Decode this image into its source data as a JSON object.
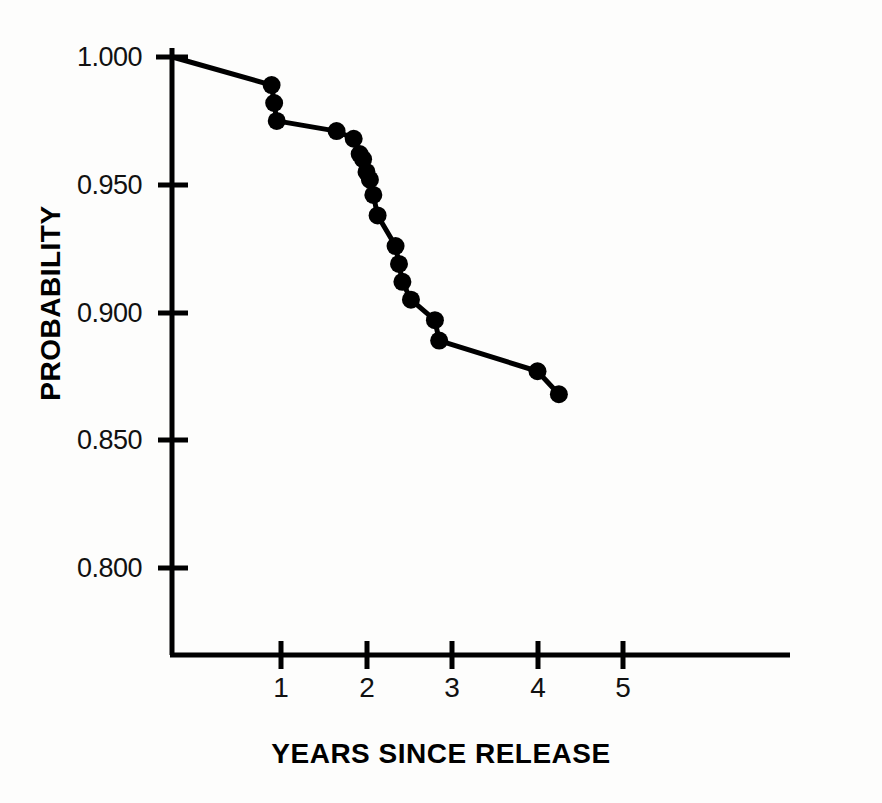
{
  "chart_data": {
    "type": "line",
    "title": "",
    "subtitle": "",
    "xlabel": "YEARS SINCE RELEASE",
    "ylabel": "PROBABILITY",
    "xlim": [
      -0.28,
      6.0
    ],
    "ylim": [
      0.766,
      1.005
    ],
    "grid": false,
    "legend": null,
    "marker": "filled-circle",
    "line_color": "#000000",
    "marker_color": "#000000",
    "background_color": "#fdfdfc",
    "xticks": [
      1,
      2,
      3,
      4,
      5
    ],
    "xtick_labels": [
      "1",
      "2",
      "3",
      "4",
      "5"
    ],
    "yticks": [
      1.0,
      0.95,
      0.9,
      0.85,
      0.8
    ],
    "ytick_labels": [
      "1.000",
      "0.950",
      "0.900",
      "0.850",
      "0.800"
    ],
    "x": [
      -0.27,
      0.89,
      0.92,
      0.95,
      1.65,
      1.85,
      1.92,
      1.96,
      2.0,
      2.04,
      2.08,
      2.13,
      2.34,
      2.38,
      2.42,
      2.52,
      2.8,
      2.85,
      4.0,
      4.25
    ],
    "y": [
      1.0,
      0.989,
      0.982,
      0.975,
      0.971,
      0.968,
      0.962,
      0.96,
      0.955,
      0.952,
      0.946,
      0.938,
      0.926,
      0.919,
      0.912,
      0.905,
      0.897,
      0.889,
      0.877,
      0.868
    ],
    "points": [
      {
        "x": -0.27,
        "y": 1.0,
        "marker": false
      },
      {
        "x": 0.89,
        "y": 0.989,
        "marker": true
      },
      {
        "x": 0.92,
        "y": 0.982,
        "marker": true
      },
      {
        "x": 0.95,
        "y": 0.975,
        "marker": true
      },
      {
        "x": 1.65,
        "y": 0.971,
        "marker": true
      },
      {
        "x": 1.85,
        "y": 0.968,
        "marker": true
      },
      {
        "x": 1.92,
        "y": 0.962,
        "marker": true
      },
      {
        "x": 1.96,
        "y": 0.96,
        "marker": true
      },
      {
        "x": 2.0,
        "y": 0.955,
        "marker": true
      },
      {
        "x": 2.04,
        "y": 0.952,
        "marker": true
      },
      {
        "x": 2.08,
        "y": 0.946,
        "marker": true
      },
      {
        "x": 2.13,
        "y": 0.938,
        "marker": true
      },
      {
        "x": 2.34,
        "y": 0.926,
        "marker": true
      },
      {
        "x": 2.38,
        "y": 0.919,
        "marker": true
      },
      {
        "x": 2.42,
        "y": 0.912,
        "marker": true
      },
      {
        "x": 2.52,
        "y": 0.905,
        "marker": true
      },
      {
        "x": 2.8,
        "y": 0.897,
        "marker": true
      },
      {
        "x": 2.85,
        "y": 0.889,
        "marker": true
      },
      {
        "x": 4.0,
        "y": 0.877,
        "marker": true
      },
      {
        "x": 4.25,
        "y": 0.868,
        "marker": true
      }
    ]
  },
  "axes": {
    "y_tick_labels": [
      "1.000",
      "0.950",
      "0.900",
      "0.850",
      "0.800"
    ],
    "x_tick_labels": [
      "1",
      "2",
      "3",
      "4",
      "5"
    ],
    "x_axis_title": "YEARS SINCE RELEASE",
    "y_axis_title": "PROBABILITY"
  }
}
